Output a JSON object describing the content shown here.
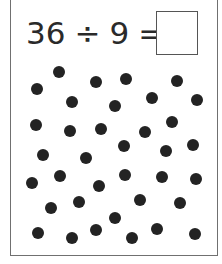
{
  "equation": {
    "dividend": "36",
    "operator": "÷",
    "divisor": "9",
    "equals": "=",
    "answer": ""
  },
  "colors": {
    "dot": "#232323",
    "text": "#2a2a2a",
    "border": "#707070"
  },
  "dots": {
    "count": 36,
    "positions": [
      [
        37,
        89
      ],
      [
        59,
        72
      ],
      [
        96,
        82
      ],
      [
        126,
        79
      ],
      [
        177,
        81
      ],
      [
        72,
        102
      ],
      [
        115,
        106
      ],
      [
        152,
        98
      ],
      [
        197,
        100
      ],
      [
        36,
        125
      ],
      [
        70,
        131
      ],
      [
        101,
        129
      ],
      [
        145,
        132
      ],
      [
        172,
        122
      ],
      [
        43,
        155
      ],
      [
        86,
        158
      ],
      [
        124,
        146
      ],
      [
        166,
        151
      ],
      [
        193,
        145
      ],
      [
        32,
        183
      ],
      [
        60,
        176
      ],
      [
        99,
        186
      ],
      [
        125,
        175
      ],
      [
        162,
        177
      ],
      [
        196,
        179
      ],
      [
        51,
        208
      ],
      [
        79,
        202
      ],
      [
        140,
        200
      ],
      [
        180,
        203
      ],
      [
        38,
        233
      ],
      [
        72,
        238
      ],
      [
        96,
        230
      ],
      [
        115,
        218
      ],
      [
        132,
        238
      ],
      [
        157,
        229
      ],
      [
        195,
        234
      ]
    ]
  }
}
